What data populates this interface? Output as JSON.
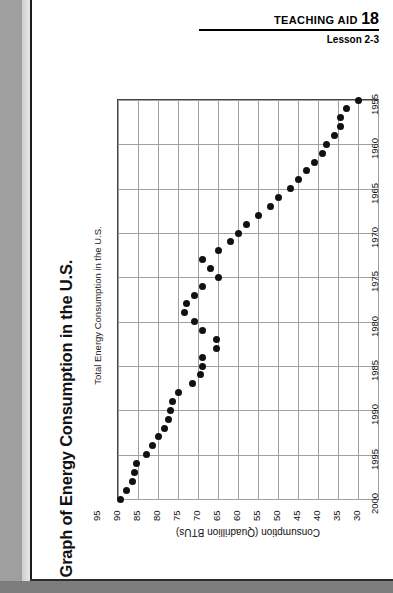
{
  "header": {
    "teaching_aid_label": "TEACHING AID",
    "teaching_aid_number": "18",
    "lesson": "Lesson 2-3"
  },
  "page": {
    "title": "Graph of Energy Consumption in the U.S.",
    "subtitle": "Total Energy Consumption in the U.S."
  },
  "chart_data": {
    "type": "scatter",
    "title": "Total Energy Consumption in the U.S.",
    "orientation": "rotated-90-ccw",
    "xlabel": "Consumption (Quadrillion BTUs)",
    "ylabel": "",
    "xlim": [
      95,
      30
    ],
    "ylim": [
      1955,
      2000
    ],
    "x_ticks": [
      "95",
      "90",
      "85",
      "80",
      "75",
      "70",
      "65",
      "60",
      "55",
      "50",
      "45",
      "40",
      "35",
      "30"
    ],
    "y_ticks": [
      "1955",
      "1960",
      "1965",
      "1970",
      "1975",
      "1980",
      "1985",
      "1990",
      "1995",
      "2000"
    ],
    "grid": true,
    "legend": "none",
    "x_key": "year",
    "y_key": "consumption_quadrillion_btu",
    "points": [
      {
        "year": 1955,
        "consumption_quadrillion_btu": 35.0
      },
      {
        "year": 1956,
        "consumption_quadrillion_btu": 38.0
      },
      {
        "year": 1957,
        "consumption_quadrillion_btu": 39.5
      },
      {
        "year": 1958,
        "consumption_quadrillion_btu": 39.5
      },
      {
        "year": 1959,
        "consumption_quadrillion_btu": 41.0
      },
      {
        "year": 1960,
        "consumption_quadrillion_btu": 43.0
      },
      {
        "year": 1961,
        "consumption_quadrillion_btu": 44.0
      },
      {
        "year": 1962,
        "consumption_quadrillion_btu": 46.0
      },
      {
        "year": 1963,
        "consumption_quadrillion_btu": 48.0
      },
      {
        "year": 1964,
        "consumption_quadrillion_btu": 50.0
      },
      {
        "year": 1965,
        "consumption_quadrillion_btu": 52.0
      },
      {
        "year": 1966,
        "consumption_quadrillion_btu": 55.0
      },
      {
        "year": 1967,
        "consumption_quadrillion_btu": 57.0
      },
      {
        "year": 1968,
        "consumption_quadrillion_btu": 60.0
      },
      {
        "year": 1969,
        "consumption_quadrillion_btu": 63.0
      },
      {
        "year": 1970,
        "consumption_quadrillion_btu": 65.0
      },
      {
        "year": 1971,
        "consumption_quadrillion_btu": 67.0
      },
      {
        "year": 1972,
        "consumption_quadrillion_btu": 70.0
      },
      {
        "year": 1973,
        "consumption_quadrillion_btu": 74.0
      },
      {
        "year": 1974,
        "consumption_quadrillion_btu": 72.0
      },
      {
        "year": 1975,
        "consumption_quadrillion_btu": 70.0
      },
      {
        "year": 1976,
        "consumption_quadrillion_btu": 74.0
      },
      {
        "year": 1977,
        "consumption_quadrillion_btu": 76.0
      },
      {
        "year": 1978,
        "consumption_quadrillion_btu": 78.0
      },
      {
        "year": 1979,
        "consumption_quadrillion_btu": 78.5
      },
      {
        "year": 1980,
        "consumption_quadrillion_btu": 76.0
      },
      {
        "year": 1981,
        "consumption_quadrillion_btu": 74.0
      },
      {
        "year": 1982,
        "consumption_quadrillion_btu": 70.5
      },
      {
        "year": 1983,
        "consumption_quadrillion_btu": 70.5
      },
      {
        "year": 1984,
        "consumption_quadrillion_btu": 74.0
      },
      {
        "year": 1985,
        "consumption_quadrillion_btu": 74.0
      },
      {
        "year": 1986,
        "consumption_quadrillion_btu": 74.5
      },
      {
        "year": 1987,
        "consumption_quadrillion_btu": 76.5
      },
      {
        "year": 1988,
        "consumption_quadrillion_btu": 80.0
      },
      {
        "year": 1989,
        "consumption_quadrillion_btu": 81.5
      },
      {
        "year": 1990,
        "consumption_quadrillion_btu": 82.0
      },
      {
        "year": 1991,
        "consumption_quadrillion_btu": 82.5
      },
      {
        "year": 1992,
        "consumption_quadrillion_btu": 83.5
      },
      {
        "year": 1993,
        "consumption_quadrillion_btu": 85.0
      },
      {
        "year": 1994,
        "consumption_quadrillion_btu": 86.5
      },
      {
        "year": 1995,
        "consumption_quadrillion_btu": 88.0
      },
      {
        "year": 1996,
        "consumption_quadrillion_btu": 90.5
      },
      {
        "year": 1997,
        "consumption_quadrillion_btu": 91.0
      },
      {
        "year": 1998,
        "consumption_quadrillion_btu": 91.5
      },
      {
        "year": 1999,
        "consumption_quadrillion_btu": 93.0
      },
      {
        "year": 2000,
        "consumption_quadrillion_btu": 94.5
      }
    ]
  }
}
